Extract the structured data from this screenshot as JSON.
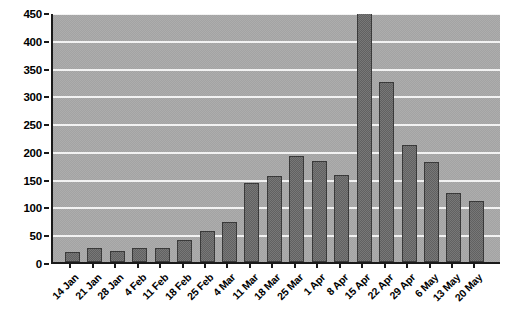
{
  "chart_data": {
    "type": "bar",
    "title": "",
    "subtitle": "",
    "xlabel": "",
    "ylabel": "",
    "ylim": [
      0,
      450
    ],
    "ytick_step": 50,
    "yticks": [
      0,
      50,
      100,
      150,
      200,
      250,
      300,
      350,
      400,
      450
    ],
    "grid": true,
    "legend": false,
    "legend_position": "none",
    "categories": [
      "14 Jan",
      "21 Jan",
      "28 Jan",
      "4 Feb",
      "11 Feb",
      "18 Feb",
      "25 Feb",
      "4 Mar",
      "11 Mar",
      "18 Mar",
      "25 Mar",
      "1 Apr",
      "8 Apr",
      "15 Apr",
      "22 Apr",
      "29 Apr",
      "6 May",
      "13 May",
      "20 May"
    ],
    "values": [
      18,
      25,
      20,
      25,
      25,
      40,
      55,
      72,
      142,
      154,
      190,
      182,
      157,
      450,
      324,
      210,
      180,
      125,
      110
    ],
    "annotations": []
  },
  "style": {
    "bar_fill": "#6d6d6d",
    "bar_border": "#3a3a3a",
    "plot_background": "#a9a9a9",
    "gridline_color": "#f2f2f2",
    "axis_color": "#1a1a1a",
    "page_background": "#ffffff",
    "text_color": "#000000"
  }
}
